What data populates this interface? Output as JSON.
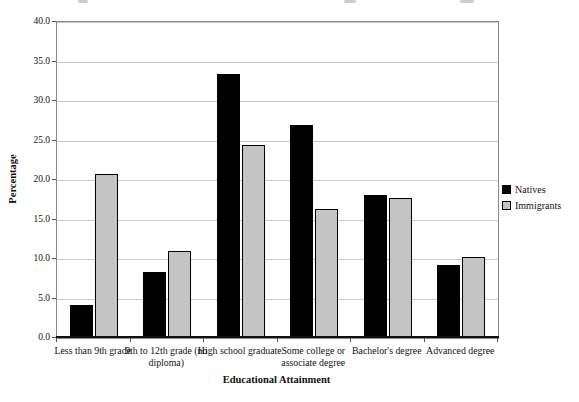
{
  "chart_data": {
    "type": "bar",
    "title": "",
    "xlabel": "Educational Attainment",
    "ylabel": "Percentage",
    "categories": [
      "Less than 9th grade",
      "9th to 12th grade (no diploma)",
      "High school graduate",
      "Some college or associate degree",
      "Bachelor's degree",
      "Advanced degree"
    ],
    "series": [
      {
        "name": "Natives",
        "color": "#000000",
        "values": [
          4.2,
          8.4,
          33.4,
          27.0,
          18.1,
          9.2
        ]
      },
      {
        "name": "Immigrants",
        "color": "#c4c4c4",
        "values": [
          20.8,
          11.0,
          24.4,
          16.3,
          17.7,
          10.2
        ]
      }
    ],
    "ylim": [
      0,
      40
    ],
    "ytick_step": 5,
    "ytick_labels": [
      "0.0",
      "5.0",
      "10.0",
      "15.0",
      "20.0",
      "25.0",
      "30.0",
      "35.0",
      "40.0"
    ],
    "grid": "horizontal",
    "legend_position": "right"
  },
  "colors": {
    "gridline": "#c9c9c9",
    "plot_border": "#8a8a8a",
    "axis": "#111111",
    "background": "#ffffff"
  }
}
